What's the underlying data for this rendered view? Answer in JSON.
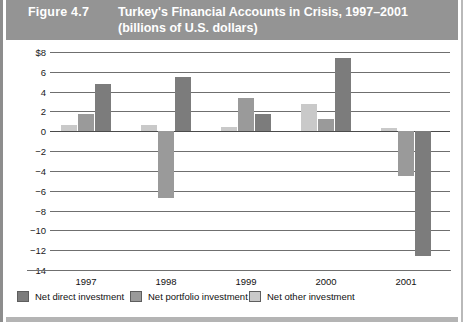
{
  "figure": {
    "number_label": "Figure 4.7",
    "title_line1": "Turkey's Financial Accounts in Crisis, 1997–2001",
    "title_line2": "(billions of U.S. dollars)",
    "header_bg": "#949494",
    "header_text_color": "#ffffff"
  },
  "legend": {
    "items": [
      {
        "label": "Net direct investment",
        "color": "#7c7c7c"
      },
      {
        "label": "Net portfolio investment",
        "color": "#9a9a9a"
      },
      {
        "label": "Net other investment",
        "color": "#c9c9c9"
      }
    ]
  },
  "axis": {
    "y_ticks": [
      "$8",
      "6",
      "4",
      "2",
      "0",
      "−2",
      "−4",
      "−6",
      "−8",
      "−10",
      "−12",
      "−14"
    ],
    "y_tick_values": [
      8,
      6,
      4,
      2,
      0,
      -2,
      -4,
      -6,
      -8,
      -10,
      -12,
      -14
    ],
    "x_ticks": [
      "1997",
      "1998",
      "1999",
      "2000",
      "2001"
    ]
  },
  "chart_data": {
    "type": "bar",
    "title": "Turkey's Financial Accounts in Crisis, 1997–2001 (billions of U.S. dollars)",
    "xlabel": "",
    "ylabel": "billions of U.S. dollars",
    "ylim": [
      -14,
      8
    ],
    "grid": true,
    "legend_position": "bottom-left",
    "categories": [
      "1997",
      "1998",
      "1999",
      "2000",
      "2001"
    ],
    "series": [
      {
        "name": "Net other investment",
        "color": "#c9c9c9",
        "values": [
          0.6,
          0.6,
          0.4,
          2.8,
          0.3
        ]
      },
      {
        "name": "Net portfolio investment",
        "color": "#9a9a9a",
        "values": [
          1.7,
          -6.7,
          3.4,
          1.2,
          -4.5
        ]
      },
      {
        "name": "Net direct investment",
        "color": "#7c7c7c",
        "values": [
          4.8,
          5.5,
          1.7,
          7.4,
          -12.6
        ]
      }
    ]
  }
}
